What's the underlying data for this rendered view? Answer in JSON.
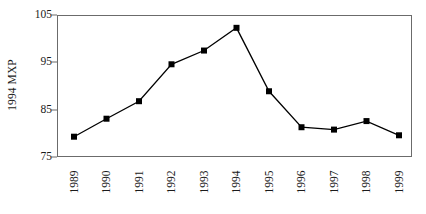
{
  "chart_data": {
    "type": "line",
    "title": "",
    "subtitle": "",
    "xlabel": "",
    "ylabel": "1994 MXP",
    "categories": [
      "1989",
      "1990",
      "1991",
      "1992",
      "1993",
      "1994",
      "1995",
      "1996",
      "1997",
      "1998",
      "1999"
    ],
    "values": [
      79.5,
      83.3,
      87.0,
      94.8,
      97.7,
      102.5,
      89.1,
      81.5,
      81.0,
      82.8,
      79.8
    ],
    "series": [
      {
        "name": "1994 MXP",
        "values": [
          79.5,
          83.3,
          87.0,
          94.8,
          97.7,
          102.5,
          89.1,
          81.5,
          81.0,
          82.8,
          79.8
        ]
      }
    ],
    "ylim": [
      75,
      105
    ],
    "yticks": [
      75,
      85,
      95,
      105
    ],
    "ytick_labels": [
      "75",
      "85",
      "95",
      "105"
    ],
    "xtick_labels": [
      "1989",
      "1990",
      "1991",
      "1992",
      "1993",
      "1994",
      "1995",
      "1996",
      "1997",
      "1998",
      "1999"
    ],
    "xtick_rotation": 90,
    "grid": false,
    "legend": null,
    "legend_position": "none",
    "marker": "square",
    "marker_color": "#000000",
    "line_color": "#000000",
    "line_width": 1.2,
    "marker_size": 6,
    "axis_color": "#6b6b6b",
    "background_color": "#ffffff",
    "annotations": []
  },
  "axes": {
    "y_title": "1994 MXP",
    "y_tick_0": "75",
    "y_tick_1": "85",
    "y_tick_2": "95",
    "y_tick_3": "105"
  }
}
